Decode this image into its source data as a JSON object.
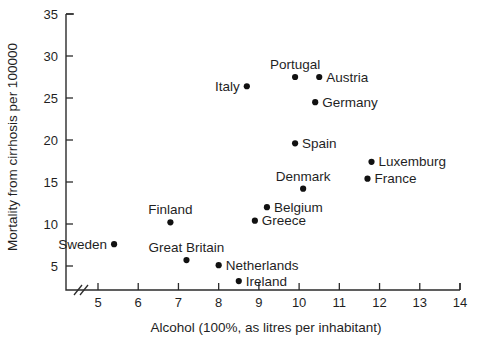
{
  "chart_data": {
    "type": "scatter",
    "title": "",
    "xlabel": "Alcohol (100%, as litres per inhabitant)",
    "ylabel": "Mortality from cirrhosis per 100000",
    "xlim": [
      4.6,
      14
    ],
    "ylim": [
      0,
      35
    ],
    "xticks": [
      5,
      6,
      7,
      8,
      9,
      10,
      11,
      12,
      13,
      14
    ],
    "yticks": [
      5,
      10,
      15,
      20,
      25,
      30,
      35
    ],
    "xtick_labels": [
      "5",
      "6",
      "7",
      "8",
      "9",
      "10",
      "11",
      "12",
      "13",
      "14"
    ],
    "ytick_labels": [
      "5",
      "10",
      "15",
      "20",
      "25",
      "30",
      "35"
    ],
    "grid": false,
    "legend": "none",
    "axis_break": {
      "axis": "x",
      "note": "break mark near origin on x-axis"
    },
    "points": [
      {
        "name": "Sweden",
        "x": 5.4,
        "y": 7.6,
        "label_pos": "left"
      },
      {
        "name": "Finland",
        "x": 6.8,
        "y": 10.2,
        "label_pos": "above"
      },
      {
        "name": "Great Britain",
        "x": 7.2,
        "y": 5.7,
        "label_pos": "above"
      },
      {
        "name": "Netherlands",
        "x": 8.0,
        "y": 5.1,
        "label_pos": "right"
      },
      {
        "name": "Ireland",
        "x": 8.5,
        "y": 3.2,
        "label_pos": "right"
      },
      {
        "name": "Greece",
        "x": 8.9,
        "y": 10.4,
        "label_pos": "right"
      },
      {
        "name": "Belgium",
        "x": 9.2,
        "y": 12.0,
        "label_pos": "right"
      },
      {
        "name": "Italy",
        "x": 8.7,
        "y": 26.4,
        "label_pos": "left"
      },
      {
        "name": "Portugal",
        "x": 9.9,
        "y": 27.5,
        "label_pos": "above"
      },
      {
        "name": "Spain",
        "x": 9.9,
        "y": 19.6,
        "label_pos": "right"
      },
      {
        "name": "Denmark",
        "x": 10.1,
        "y": 14.2,
        "label_pos": "above"
      },
      {
        "name": "Austria",
        "x": 10.5,
        "y": 27.5,
        "label_pos": "right"
      },
      {
        "name": "Germany",
        "x": 10.4,
        "y": 24.5,
        "label_pos": "right"
      },
      {
        "name": "Luxemburg",
        "x": 11.8,
        "y": 17.4,
        "label_pos": "right"
      },
      {
        "name": "France",
        "x": 11.7,
        "y": 15.4,
        "label_pos": "right"
      }
    ]
  }
}
